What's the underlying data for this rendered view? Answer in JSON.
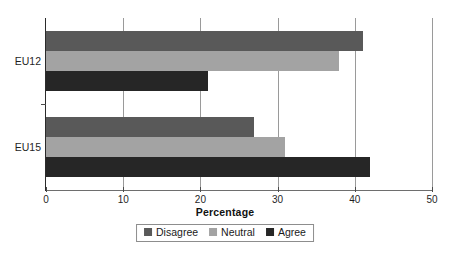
{
  "chart_data": {
    "type": "bar",
    "orientation": "horizontal",
    "title": "",
    "xlabel": "Percentage",
    "ylabel": "",
    "xlim": [
      0,
      50
    ],
    "xticks": [
      0,
      10,
      20,
      30,
      40,
      50
    ],
    "xtick_labels": [
      "0",
      "10",
      "20",
      "30",
      "40",
      "50"
    ],
    "categories": [
      "EU12",
      "EU15"
    ],
    "grid": "vertical",
    "legend_position": "bottom-center",
    "series": [
      {
        "name": "Disagree",
        "color": "#595959",
        "values": [
          41,
          27
        ]
      },
      {
        "name": "Neutral",
        "color": "#a3a3a3",
        "values": [
          38,
          31
        ]
      },
      {
        "name": "Agree",
        "color": "#262626",
        "values": [
          21,
          42
        ]
      }
    ]
  },
  "axis": {
    "x_title": "Percentage",
    "tick0": "0",
    "tick1": "10",
    "tick2": "20",
    "tick3": "30",
    "tick4": "40",
    "tick5": "50",
    "cat0": "EU12",
    "cat1": "EU15"
  },
  "legend": {
    "items": [
      {
        "label": "Disagree",
        "color": "#595959"
      },
      {
        "label": "Neutral",
        "color": "#a3a3a3"
      },
      {
        "label": "Agree",
        "color": "#262626"
      }
    ]
  }
}
